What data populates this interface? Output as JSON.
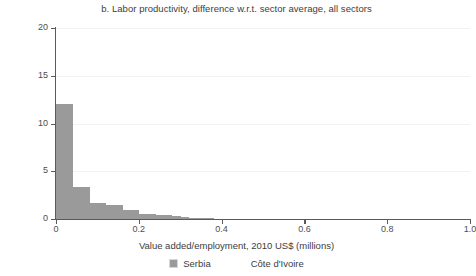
{
  "chart_data": {
    "type": "bar",
    "title": "b. Labor productivity, difference w.r.t. sector average, all sectors",
    "xlabel": "Value added/employment, 2010 US$ (millions)",
    "ylabel": "Density",
    "xlim": [
      0,
      1.0
    ],
    "ylim": [
      0,
      20
    ],
    "xticks": [
      "0",
      "0.2",
      "0.4",
      "0.6",
      "0.8",
      "1.0"
    ],
    "xtick_values": [
      0,
      0.2,
      0.4,
      0.6,
      0.8,
      1.0
    ],
    "yticks": [
      "0",
      "5",
      "10",
      "15",
      "20"
    ],
    "ytick_values": [
      0,
      5,
      10,
      15,
      20
    ],
    "grid": "horizontal-faint",
    "legend_position": "bottom-center",
    "bin_width": 0.02,
    "series": [
      {
        "name": "Serbia",
        "color": "#9a9a9a",
        "bin_starts": [
          0.0,
          0.02,
          0.04,
          0.06,
          0.08,
          0.1,
          0.12,
          0.14,
          0.16,
          0.18,
          0.2,
          0.22,
          0.24,
          0.26,
          0.28,
          0.3,
          0.32,
          0.34,
          0.36
        ],
        "values": [
          12.0,
          12.0,
          3.4,
          3.4,
          1.7,
          1.7,
          1.5,
          1.5,
          0.9,
          0.9,
          0.55,
          0.55,
          0.45,
          0.45,
          0.28,
          0.18,
          0.12,
          0.08,
          0.05
        ]
      },
      {
        "name": "Côte d'Ivoire",
        "color": "#ffffff",
        "bin_starts": [],
        "values": []
      }
    ],
    "legend": [
      {
        "label": "Serbia",
        "color": "#9a9a9a",
        "swatch_visible": true
      },
      {
        "label": "Côte d'Ivoire",
        "color": "#ffffff",
        "swatch_visible": false
      }
    ]
  }
}
